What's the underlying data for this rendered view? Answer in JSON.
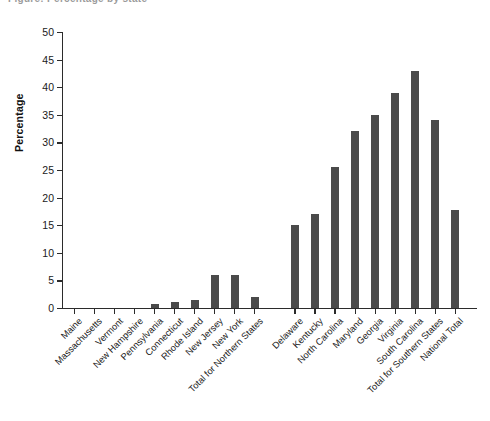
{
  "title_sliver": "Figure: Percentage by state",
  "chart_data": {
    "type": "bar",
    "title": "",
    "xlabel": "",
    "ylabel": "Percentage",
    "ylim": [
      0,
      50
    ],
    "yticks": [
      0,
      5,
      10,
      15,
      20,
      25,
      30,
      35,
      40,
      45,
      50
    ],
    "grid": false,
    "legend": "none",
    "bar_color": "#4a4a4a",
    "axis_color": "#2b2b2b",
    "gap_after_index": 8,
    "categories": [
      "Maine",
      "Massachusetts",
      "Vermont",
      "New Hampshire",
      "Pennsylvania",
      "Connecticut",
      "Rhode Island",
      "New Jersey",
      "New York",
      "Total for Northern States",
      "Delaware",
      "Kentucky",
      "North Carolina",
      "Maryland",
      "Georgia",
      "Virginia",
      "South Carolina",
      "Total for Southern States",
      "National Total"
    ],
    "values": [
      0,
      0,
      0,
      0,
      0.7,
      1.0,
      1.5,
      6.0,
      6.0,
      2.0,
      15.0,
      17.0,
      25.5,
      32.0,
      35.0,
      39.0,
      43.0,
      34.0,
      17.8
    ]
  }
}
